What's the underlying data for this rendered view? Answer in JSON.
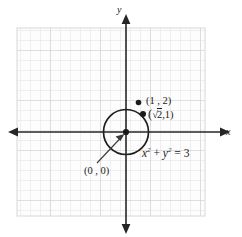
{
  "figure": {
    "type": "coordinate-plane-graph",
    "title": "",
    "axes": {
      "x_label": "x",
      "y_label": "y",
      "x_axis_name": "horizontal-axis",
      "y_axis_name": "vertical-axis",
      "arrows": [
        "left",
        "right",
        "up",
        "down"
      ]
    },
    "grid": {
      "visible": true,
      "color": "#dcdcdc",
      "cell_size_px": 10,
      "major_every": 5,
      "major_color": "#cfcfcf"
    },
    "curve": {
      "shape": "circle",
      "equation": "x",
      "equation_full": "x² + y² = 3",
      "center": "(0 , 0)",
      "radius_value": 1.732,
      "stroke": "#1a1a1a"
    },
    "labels": {
      "point_1_2": "(1 , 2)",
      "point_sqrt2_1_open": "(",
      "point_sqrt2_1_radical": "2",
      "point_sqrt2_1_rest": ",1)",
      "origin": "(0 , 0)",
      "equation_x": "x",
      "equation_exp1": "2",
      "equation_plus": " + ",
      "equation_y": "y",
      "equation_exp2": "2",
      "equation_eq": " = 3"
    },
    "points": [
      {
        "name": "point-1-2",
        "label": "(1 , 2)",
        "x": 1,
        "y": 2,
        "on_circle": false
      },
      {
        "name": "point-sqrt2-1",
        "label": "(√2 , 1)",
        "x": 1.414,
        "y": 1,
        "on_circle": true
      },
      {
        "name": "point-origin",
        "label": "(0 , 0)",
        "x": 0,
        "y": 0,
        "on_circle": false
      }
    ],
    "colors": {
      "ink": "#1a1a1a",
      "grid_minor": "#dedede",
      "grid_major": "#cccccc",
      "background": "#ffffff"
    }
  }
}
